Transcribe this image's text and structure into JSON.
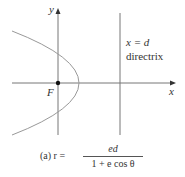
{
  "figure": {
    "axis_labels": {
      "x": "x",
      "y": "y"
    },
    "focus_label": "F",
    "directrix_equation": "x = d",
    "directrix_label": "directrix",
    "caption": {
      "prefix": "(a) r =",
      "numerator": "ed",
      "denominator": "1 + e cos θ"
    }
  },
  "colors": {
    "axis": "#666666",
    "curve": "#888888",
    "text": "#333333"
  }
}
